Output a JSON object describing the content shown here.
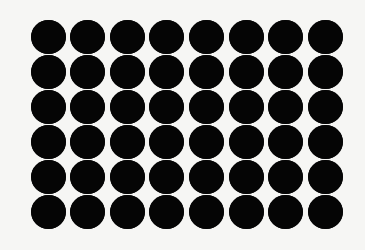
{
  "image": {
    "description": "Grid of black circles on white background",
    "background_color": "#f6f6f4",
    "dot_color": "#050505",
    "rows": 6,
    "columns": 8,
    "total_dots": 48,
    "first_center": [
      48,
      37
    ],
    "col_spacing": 39.6,
    "row_spacing": 35,
    "dot_width": 35,
    "dot_height": 34
  }
}
